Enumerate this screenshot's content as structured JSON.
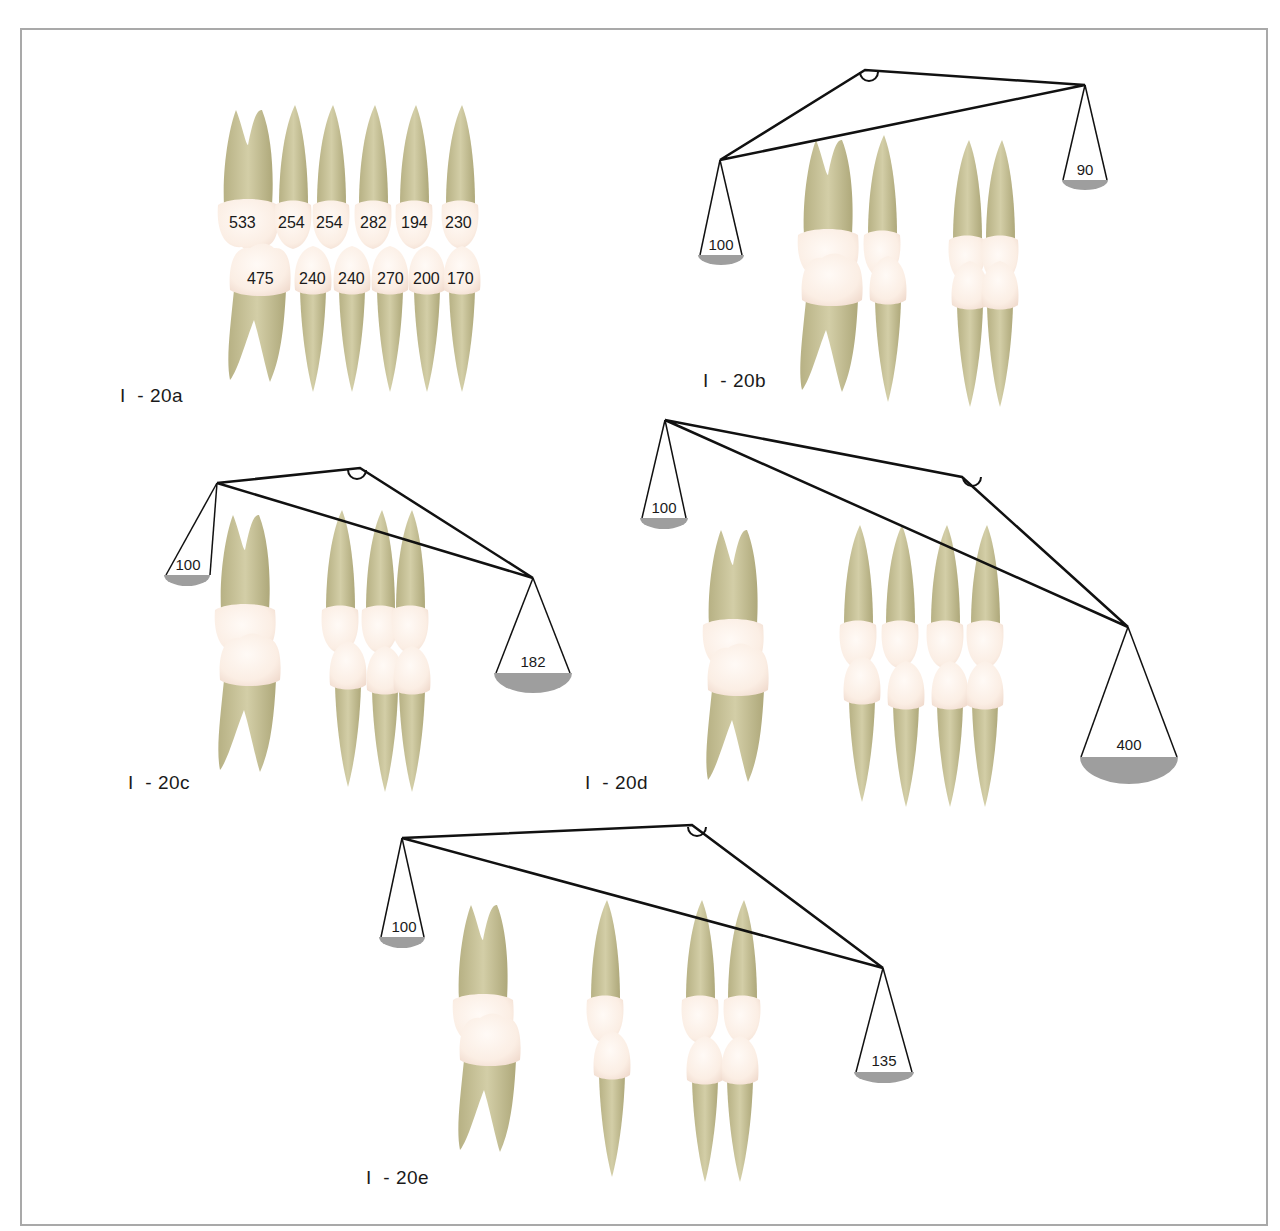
{
  "colors": {
    "frame": "#a9a9a9",
    "root": "#c9c49a",
    "root_dark": "#a9a374",
    "crown": "#fbeee5",
    "crown_edge": "#f2ddd0",
    "pan_fill": "#9e9e9e",
    "line": "#111111"
  },
  "figures": {
    "a": {
      "label": "I  - 20a",
      "upper_values": [
        "533",
        "254",
        "254",
        "282",
        "194",
        "230"
      ],
      "lower_values": [
        "475",
        "240",
        "240",
        "270",
        "200",
        "170"
      ]
    },
    "b": {
      "label": "I  - 20b",
      "left_pan": "100",
      "right_pan": "90"
    },
    "c": {
      "label": "I  - 20c",
      "left_pan": "100",
      "right_pan": "182"
    },
    "d": {
      "label": "I  - 20d",
      "left_pan": "100",
      "right_pan": "400"
    },
    "e": {
      "label": "I  - 20e",
      "left_pan": "100",
      "right_pan": "135"
    }
  }
}
